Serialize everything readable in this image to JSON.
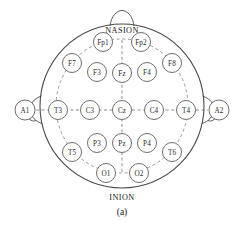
{
  "figure": {
    "caption": "(a)",
    "caption_x": 122,
    "caption_y": 212,
    "background_color": "#ffffff",
    "outline_color": "#4a4a4a",
    "dashed_color": "#7d7d7d",
    "electrode_stroke_color": "#6e6e6e",
    "label_color": "#2b2b2b"
  },
  "head": {
    "center_x": 122,
    "center_y": 106,
    "radius": 82
  },
  "landmarks": [
    {
      "name": "nasion",
      "text": "NASION",
      "x": 122,
      "y": 30
    },
    {
      "name": "inion",
      "text": "INION",
      "x": 122,
      "y": 197
    }
  ],
  "dashed_ring": {
    "center_x": 122,
    "center_y": 106,
    "radius_x": 66,
    "radius_y": 67
  },
  "chains": {
    "horizontal": [
      "T3",
      "C3",
      "Cz",
      "C4",
      "T4"
    ],
    "vertical": [
      "Fpz",
      "Fz",
      "Cz",
      "Pz",
      "Oz"
    ]
  },
  "electrodes": [
    {
      "name": "Fp1",
      "label": "Fp1",
      "x": 103,
      "y": 42,
      "r": 9.5
    },
    {
      "name": "Fp2",
      "label": "Fp2",
      "x": 141,
      "y": 42,
      "r": 9.5
    },
    {
      "name": "F7",
      "label": "F7",
      "x": 72,
      "y": 63,
      "r": 9.5
    },
    {
      "name": "F3",
      "label": "F3",
      "x": 97,
      "y": 72,
      "r": 9.5
    },
    {
      "name": "Fz",
      "label": "Fz",
      "x": 122,
      "y": 73,
      "r": 9.5
    },
    {
      "name": "F4",
      "label": "F4",
      "x": 147,
      "y": 72,
      "r": 9.5
    },
    {
      "name": "F8",
      "label": "F8",
      "x": 172,
      "y": 63,
      "r": 9.5
    },
    {
      "name": "T3",
      "label": "T3",
      "x": 58,
      "y": 110,
      "r": 9.5
    },
    {
      "name": "C3",
      "label": "C3",
      "x": 90,
      "y": 110,
      "r": 9.5
    },
    {
      "name": "Cz",
      "label": "Cz",
      "x": 122,
      "y": 110,
      "r": 9.5
    },
    {
      "name": "C4",
      "label": "C4",
      "x": 154,
      "y": 110,
      "r": 9.5
    },
    {
      "name": "T4",
      "label": "T4",
      "x": 186,
      "y": 110,
      "r": 9.5
    },
    {
      "name": "T5",
      "label": "T5",
      "x": 72,
      "y": 152,
      "r": 9.5
    },
    {
      "name": "P3",
      "label": "P3",
      "x": 97,
      "y": 143,
      "r": 9.5
    },
    {
      "name": "Pz",
      "label": "Pz",
      "x": 122,
      "y": 143,
      "r": 9.5
    },
    {
      "name": "P4",
      "label": "P4",
      "x": 147,
      "y": 143,
      "r": 9.5
    },
    {
      "name": "T6",
      "label": "T6",
      "x": 172,
      "y": 152,
      "r": 9.5
    },
    {
      "name": "O1",
      "label": "O1",
      "x": 106,
      "y": 173,
      "r": 9.5
    },
    {
      "name": "O2",
      "label": "O2",
      "x": 139,
      "y": 173,
      "r": 9.5
    }
  ],
  "reference_electrodes": [
    {
      "name": "A1",
      "label": "A1",
      "x": 25,
      "y": 110,
      "r": 10
    },
    {
      "name": "A2",
      "label": "A2",
      "x": 219,
      "y": 110,
      "r": 10
    }
  ]
}
